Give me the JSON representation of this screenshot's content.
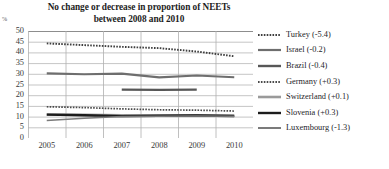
{
  "chart_data": {
    "type": "line",
    "title": "No change or decrease in proportion of NEETs between 2008 and 2010",
    "title_lines": [
      "No change or decrease in proportion of NEETs",
      "between 2008 and 2010"
    ],
    "xlabel": "",
    "ylabel": "%",
    "yunit": "%",
    "categories": [
      "2005",
      "2006",
      "2007",
      "2008",
      "2009",
      "2010"
    ],
    "x": [
      2005,
      2006,
      2007,
      2008,
      2009,
      2010
    ],
    "ylim": [
      0,
      50
    ],
    "yticks": [
      0,
      5,
      10,
      15,
      20,
      25,
      30,
      35,
      40,
      45,
      50
    ],
    "grid": true,
    "legend_position": "right",
    "series": [
      {
        "name": "Turkey",
        "delta": "-5.4",
        "legend_label": "Turkey (-5.4)",
        "style": "dotted",
        "color": "#3f3f3f",
        "width": 1.9,
        "values": [
          44.2,
          43.4,
          42.6,
          42.0,
          40.4,
          38.2
        ]
      },
      {
        "name": "Israel",
        "delta": "-0.2",
        "legend_label": "Israel (-0.2)",
        "style": "solid",
        "color": "#6e6e6e",
        "width": 2.2,
        "values": [
          30.2,
          29.8,
          30.1,
          28.3,
          29.2,
          28.4
        ]
      },
      {
        "name": "Brazil",
        "delta": "-0.4",
        "legend_label": "Brazil (-0.4)",
        "style": "solid",
        "color": "#575757",
        "width": 2.4,
        "values": [
          null,
          null,
          22.6,
          22.5,
          22.6,
          null
        ]
      },
      {
        "name": "Germany",
        "delta": "+0.3",
        "legend_label": "Germany (+0.3)",
        "style": "dotted",
        "color": "#4a4a4a",
        "width": 1.7,
        "values": [
          14.6,
          14.2,
          13.6,
          13.2,
          13.0,
          12.6
        ]
      },
      {
        "name": "Switzerland",
        "delta": "+0.1",
        "legend_label": "Switzerland (+0.1)",
        "style": "solid",
        "color": "#9a9a9a",
        "width": 2.6,
        "values": [
          11.0,
          10.8,
          10.6,
          10.5,
          10.6,
          10.4
        ]
      },
      {
        "name": "Slovenia",
        "delta": "+0.3",
        "legend_label": "Slovenia (+0.3)",
        "style": "solid",
        "color": "#1c1c1c",
        "width": 2.4,
        "values": [
          10.9,
          10.6,
          10.2,
          10.4,
          10.5,
          10.3
        ]
      },
      {
        "name": "Luxembourg",
        "delta": "-1.3",
        "legend_label": "Luxembourg (-1.3)",
        "style": "solid",
        "color": "#7b7b7b",
        "width": 1.5,
        "values": [
          8.2,
          9.2,
          10.0,
          10.2,
          10.3,
          10.2
        ]
      }
    ]
  },
  "legend": {
    "items": [
      {
        "label": "Turkey (-5.4)"
      },
      {
        "label": "Israel (-0.2)"
      },
      {
        "label": "Brazil (-0.4)"
      },
      {
        "label": "Germany (+0.3)"
      },
      {
        "label": "Switzerland (+0.1)"
      },
      {
        "label": "Slovenia (+0.3)"
      },
      {
        "label": "Luxembourg (-1.3)"
      }
    ]
  }
}
